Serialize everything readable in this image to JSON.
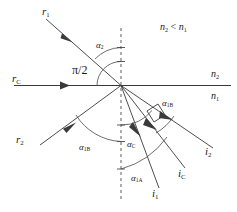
{
  "figure": {
    "colors": {
      "line": "#3a3a3a",
      "dashed_normal": "#8c8c8c",
      "arc": "#4a4a4a",
      "text": "#1a1a1a",
      "background": "#ffffff"
    }
  },
  "media": {
    "relation": "n",
    "relation_sub_left": "2",
    "relation_operator": " < ",
    "relation_sub_right": "1",
    "upper_label": "n",
    "upper_sub": "2",
    "lower_label": "n",
    "lower_sub": "1"
  },
  "rays": {
    "incident": [
      {
        "id": "r1",
        "base": "r",
        "sub": "1"
      },
      {
        "id": "rC",
        "base": "r",
        "sub": "C"
      },
      {
        "id": "r2",
        "base": "r",
        "sub": "2"
      }
    ],
    "outgoing": [
      {
        "id": "i2",
        "base": "i",
        "sub": "2"
      },
      {
        "id": "iC",
        "base": "i",
        "sub": "C"
      },
      {
        "id": "i1",
        "base": "i",
        "sub": "1"
      }
    ]
  },
  "angles": {
    "alpha2": {
      "base": "α",
      "sub": "2"
    },
    "right_angle": "π/2",
    "alpha1B_left": {
      "base": "α",
      "sub": "1B"
    },
    "alpha1B_right": {
      "base": "α",
      "sub": "1B"
    },
    "alphaC": {
      "base": "α",
      "sub": "C"
    },
    "alpha1A": {
      "base": "α",
      "sub": "1A"
    }
  }
}
